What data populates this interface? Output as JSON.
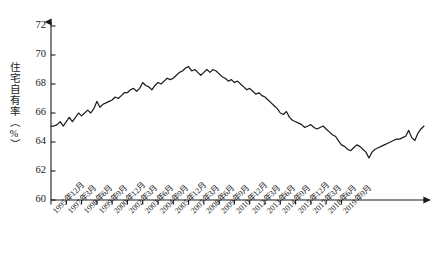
{
  "chart_data": {
    "type": "line",
    "title": "",
    "xlabel": "",
    "ylabel": "住宅自有率（%）",
    "ylim": [
      60,
      72
    ],
    "yticks": [
      60,
      62,
      64,
      66,
      68,
      70,
      72
    ],
    "ytick_labels": [
      "60",
      "62",
      "64",
      "66",
      "68",
      "70",
      "72"
    ],
    "grid": false,
    "legend": "none",
    "axis_style": "arrow-capped axes, ticks outward on x, inward on y",
    "line_color": "#1a1a1a",
    "line_width": 1.2,
    "xtick_labels": [
      "1995年12月",
      "1997年3月",
      "1998年6月",
      "1999年9月",
      "2000年12月",
      "2002年3月",
      "2003年6月",
      "2004年9月",
      "2005年12月",
      "2007年3月",
      "2008年6月",
      "2009年9月",
      "2010年12月",
      "2012年3月",
      "2013年6月",
      "2014年9月",
      "2015年12月",
      "2017年3月",
      "2018年6月",
      "2019年9月"
    ],
    "x_note": "quarterly series from 1995Q4 through 2019Q4; tick labels shown every 5 quarters",
    "series": [
      {
        "name": "住宅自有率",
        "values": [
          65.1,
          65.1,
          65.2,
          65.4,
          65.1,
          65.4,
          65.7,
          65.4,
          65.7,
          66.0,
          65.8,
          66.0,
          66.2,
          66.0,
          66.3,
          66.8,
          66.4,
          66.6,
          66.7,
          66.8,
          66.9,
          67.1,
          67.0,
          67.2,
          67.4,
          67.4,
          67.6,
          67.7,
          67.5,
          67.7,
          68.1,
          67.9,
          67.8,
          67.6,
          67.9,
          68.1,
          68.0,
          68.2,
          68.4,
          68.3,
          68.4,
          68.6,
          68.8,
          68.9,
          69.1,
          69.2,
          68.9,
          69.0,
          68.8,
          68.6,
          68.8,
          69.0,
          68.8,
          69.0,
          68.9,
          68.7,
          68.5,
          68.4,
          68.2,
          68.3,
          68.1,
          68.2,
          68.0,
          67.8,
          67.6,
          67.7,
          67.5,
          67.3,
          67.4,
          67.2,
          67.1,
          66.9,
          66.7,
          66.5,
          66.3,
          66.0,
          65.9,
          66.1,
          65.7,
          65.5,
          65.4,
          65.3,
          65.2,
          65.0,
          65.1,
          65.2,
          65.0,
          64.9,
          65.0,
          65.1,
          64.9,
          64.7,
          64.5,
          64.4,
          64.1,
          63.8,
          63.7,
          63.5,
          63.4,
          63.6,
          63.8,
          63.7,
          63.5,
          63.3,
          62.9,
          63.3,
          63.5,
          63.6,
          63.7,
          63.8,
          63.9,
          64.0,
          64.1,
          64.2,
          64.2,
          64.3,
          64.4,
          64.8,
          64.3,
          64.1,
          64.6,
          64.9,
          65.1
        ]
      }
    ]
  },
  "axes": {
    "y_axis_name": "y-axis",
    "x_axis_name": "x-axis"
  }
}
